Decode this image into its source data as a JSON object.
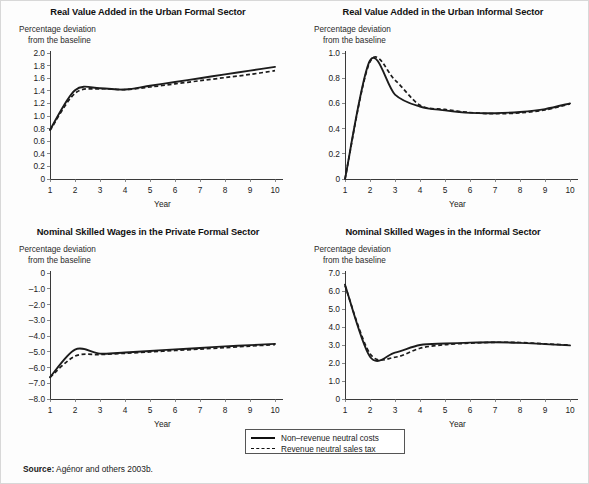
{
  "figure": {
    "background_color": "#fdfdfd",
    "line_color": "#1c1c1c",
    "axis_color": "#3a3a3a"
  },
  "legend": {
    "entries": [
      {
        "style": "solid",
        "label": "Non–revenue neutral costs"
      },
      {
        "style": "dashed",
        "label": "Revenue neutral sales tax"
      }
    ]
  },
  "source": {
    "label": "Source:",
    "text": " Agénor and others 2003b."
  },
  "axis_note": {
    "line1": "Percentage deviation",
    "line2": "from the baseline"
  },
  "chart_data": [
    {
      "type": "line",
      "panel": 0,
      "title": "Real Value Added in the Urban Formal Sector",
      "xlabel": "Year",
      "ylabel": "Percentage deviation from the baseline",
      "x": [
        1,
        2,
        3,
        4,
        5,
        6,
        7,
        8,
        9,
        10
      ],
      "xtick_labels": [
        "1",
        "2",
        "3",
        "4",
        "5",
        "6",
        "7",
        "8",
        "9",
        "10"
      ],
      "ylim": [
        0,
        2.0
      ],
      "yticks": [
        0,
        0.2,
        0.4,
        0.6,
        0.8,
        1.0,
        1.2,
        1.4,
        1.6,
        1.8,
        2.0
      ],
      "ytick_labels": [
        "0",
        "0.2",
        "0.4",
        "0.6",
        "0.8",
        "1.0",
        "1.2",
        "1.4",
        "1.6",
        "1.8",
        "2.0"
      ],
      "grid": false,
      "legend_position": "figure-bottom-center",
      "series": [
        {
          "name": "Non–revenue neutral costs",
          "style": "solid",
          "values": [
            0.78,
            1.41,
            1.44,
            1.42,
            1.48,
            1.54,
            1.6,
            1.66,
            1.72,
            1.78
          ]
        },
        {
          "name": "Revenue neutral sales tax",
          "style": "dashed",
          "values": [
            0.77,
            1.36,
            1.43,
            1.42,
            1.46,
            1.51,
            1.56,
            1.61,
            1.66,
            1.72
          ]
        }
      ]
    },
    {
      "type": "line",
      "panel": 1,
      "title": "Real Value Added in the Urban Informal Sector",
      "xlabel": "Year",
      "ylabel": "Percentage deviation from the baseline",
      "x": [
        1,
        2,
        3,
        4,
        5,
        6,
        7,
        8,
        9,
        10
      ],
      "xtick_labels": [
        "1",
        "2",
        "3",
        "4",
        "5",
        "6",
        "7",
        "8",
        "9",
        "10"
      ],
      "ylim": [
        0,
        1.0
      ],
      "yticks": [
        0,
        0.2,
        0.4,
        0.6,
        0.8,
        1.0
      ],
      "ytick_labels": [
        "0",
        "0.2",
        "0.4",
        "0.6",
        "0.8",
        "1.0"
      ],
      "grid": false,
      "legend_position": "figure-bottom-center",
      "series": [
        {
          "name": "Non–revenue neutral costs",
          "style": "solid",
          "values": [
            0.0,
            0.94,
            0.67,
            0.575,
            0.545,
            0.525,
            0.522,
            0.532,
            0.555,
            0.6
          ]
        },
        {
          "name": "Revenue neutral sales tax",
          "style": "dashed",
          "values": [
            0.0,
            0.93,
            0.785,
            0.585,
            0.552,
            0.528,
            0.518,
            0.525,
            0.548,
            0.595
          ]
        }
      ]
    },
    {
      "type": "line",
      "panel": 2,
      "title": "Nominal Skilled Wages in the Private Formal Sector",
      "xlabel": "Year",
      "ylabel": "Percentage deviation from the baseline",
      "x": [
        1,
        2,
        3,
        4,
        5,
        6,
        7,
        8,
        9,
        10
      ],
      "xtick_labels": [
        "1",
        "2",
        "3",
        "4",
        "5",
        "6",
        "7",
        "8",
        "9",
        "10"
      ],
      "ylim": [
        -8.0,
        0
      ],
      "yticks": [
        0,
        -1.0,
        -2.0,
        -3.0,
        -4.0,
        -5.0,
        -6.0,
        -7.0,
        -8.0
      ],
      "ytick_labels": [
        "0",
        "–1.0",
        "–2.0",
        "–3.0",
        "–4.0",
        "–5.0",
        "–6.0",
        "–7.0",
        "–8.0"
      ],
      "grid": false,
      "legend_position": "figure-bottom-center",
      "series": [
        {
          "name": "Non–revenue neutral costs",
          "style": "solid",
          "values": [
            -6.62,
            -4.86,
            -5.12,
            -5.05,
            -4.95,
            -4.85,
            -4.76,
            -4.66,
            -4.58,
            -4.5
          ]
        },
        {
          "name": "Revenue neutral sales tax",
          "style": "dashed",
          "values": [
            -6.62,
            -5.28,
            -5.18,
            -5.1,
            -5.01,
            -4.92,
            -4.83,
            -4.74,
            -4.64,
            -4.55
          ]
        }
      ]
    },
    {
      "type": "line",
      "panel": 3,
      "title": "Nominal Skilled Wages in the Informal Sector",
      "xlabel": "Year",
      "ylabel": "Percentage deviation from the baseline",
      "x": [
        1,
        2,
        3,
        4,
        5,
        6,
        7,
        8,
        9,
        10
      ],
      "xtick_labels": [
        "1",
        "2",
        "3",
        "4",
        "5",
        "6",
        "7",
        "8",
        "9",
        "10"
      ],
      "ylim": [
        0,
        7.0
      ],
      "yticks": [
        0,
        1.0,
        2.0,
        3.0,
        4.0,
        5.0,
        6.0,
        7.0
      ],
      "ytick_labels": [
        "0",
        "1.0",
        "2.0",
        "3.0",
        "4.0",
        "5.0",
        "6.0",
        "7.0"
      ],
      "grid": false,
      "legend_position": "figure-bottom-center",
      "series": [
        {
          "name": "Non–revenue neutral costs",
          "style": "solid",
          "values": [
            6.35,
            2.35,
            2.58,
            3.0,
            3.08,
            3.13,
            3.15,
            3.12,
            3.05,
            2.98
          ]
        },
        {
          "name": "Revenue neutral sales tax",
          "style": "dashed",
          "values": [
            6.3,
            2.52,
            2.32,
            2.82,
            3.02,
            3.1,
            3.15,
            3.14,
            3.06,
            3.0
          ]
        }
      ]
    }
  ]
}
